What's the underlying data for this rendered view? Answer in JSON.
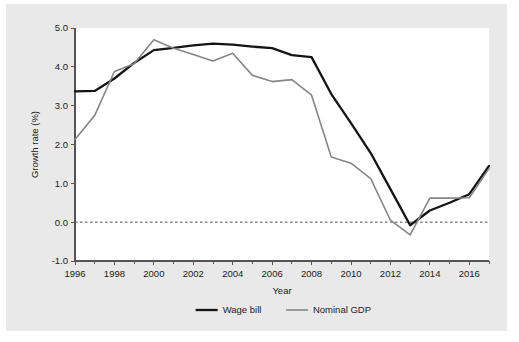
{
  "figure": {
    "background_color": "#e9e9e9",
    "plot_background_color": "#ffffff",
    "page_background_color": "#ffffff"
  },
  "chart_data": {
    "type": "line",
    "title": "",
    "xlabel": "Year",
    "ylabel": "Growth rate (%)",
    "xlim": [
      1996,
      2017
    ],
    "ylim": [
      -1.0,
      5.0
    ],
    "grid": false,
    "zero_reference_line": true,
    "zero_reference_value": 0.0,
    "legend_position": "bottom-center",
    "x_tick_labels": [
      "1996",
      "1998",
      "2000",
      "2002",
      "2004",
      "2006",
      "2008",
      "2010",
      "2012",
      "2014",
      "2016"
    ],
    "x_tick_values": [
      1996,
      1998,
      2000,
      2002,
      2004,
      2006,
      2008,
      2010,
      2012,
      2014,
      2016
    ],
    "x_minor_tick_values": [
      1997,
      1999,
      2001,
      2003,
      2005,
      2007,
      2009,
      2011,
      2013,
      2015,
      2017
    ],
    "y_tick_labels": [
      "-1.0",
      "0.0",
      "1.0",
      "2.0",
      "3.0",
      "4.0",
      "5.0"
    ],
    "y_tick_values": [
      -1.0,
      0.0,
      1.0,
      2.0,
      3.0,
      4.0,
      5.0
    ],
    "x": [
      1996,
      1997,
      1998,
      1999,
      2000,
      2001,
      2002,
      2003,
      2004,
      2005,
      2006,
      2007,
      2008,
      2009,
      2010,
      2011,
      2012,
      2013,
      2014,
      2015,
      2016,
      2017
    ],
    "series": [
      {
        "name": "Wage bill",
        "color": "#141414",
        "line_width": 2.3,
        "values": [
          3.37,
          3.38,
          3.7,
          4.1,
          4.43,
          4.49,
          4.55,
          4.6,
          4.57,
          4.52,
          4.48,
          4.3,
          4.25,
          3.3,
          2.55,
          1.78,
          0.85,
          -0.08,
          0.3,
          0.5,
          0.72,
          1.45
        ]
      },
      {
        "name": "Nominal GDP",
        "color": "#868686",
        "line_width": 1.6,
        "values": [
          2.13,
          2.75,
          3.88,
          4.08,
          4.7,
          4.48,
          4.32,
          4.15,
          4.35,
          3.78,
          3.62,
          3.67,
          3.27,
          1.68,
          1.52,
          1.12,
          0.05,
          -0.33,
          0.62,
          0.62,
          0.63,
          1.38
        ]
      }
    ],
    "legend": [
      {
        "label": "Wage bill",
        "color": "#141414"
      },
      {
        "label": "Nominal GDP",
        "color": "#868686"
      }
    ]
  }
}
